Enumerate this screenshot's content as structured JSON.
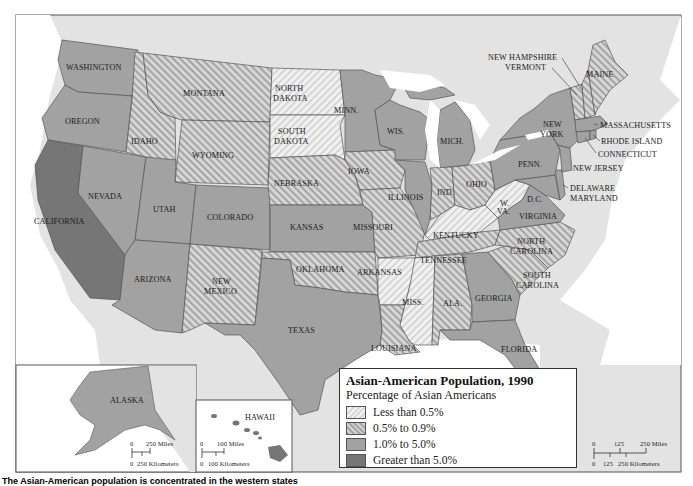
{
  "legend": {
    "title": "Asian-American Population, 1990",
    "subtitle": "Percentage of Asian Americans",
    "items": [
      {
        "label": "Less than 0.5%",
        "style": "light-hatch",
        "color": "#eeeeee"
      },
      {
        "label": "0.5% to 0.9%",
        "style": "dark-hatch",
        "color": "#c4c4c4"
      },
      {
        "label": "1.0% to 5.0%",
        "style": "solid-medium-gray",
        "color": "#a2a2a2"
      },
      {
        "label": "Greater than 5.0%",
        "style": "solid-dark-gray",
        "color": "#767676"
      }
    ]
  },
  "states": [
    {
      "name": "WASHINGTON",
      "category": "1.0% to 5.0%"
    },
    {
      "name": "OREGON",
      "category": "1.0% to 5.0%"
    },
    {
      "name": "CALIFORNIA",
      "category": "Greater than 5.0%"
    },
    {
      "name": "IDAHO",
      "category": "0.5% to 0.9%"
    },
    {
      "name": "MONTANA",
      "category": "0.5% to 0.9%"
    },
    {
      "name": "WYOMING",
      "category": "0.5% to 0.9%"
    },
    {
      "name": "NEVADA",
      "category": "1.0% to 5.0%"
    },
    {
      "name": "UTAH",
      "category": "1.0% to 5.0%"
    },
    {
      "name": "COLORADO",
      "category": "1.0% to 5.0%"
    },
    {
      "name": "ARIZONA",
      "category": "1.0% to 5.0%"
    },
    {
      "name": "NEW MEXICO",
      "category": "0.5% to 0.9%"
    },
    {
      "name": "NORTH DAKOTA",
      "category": "Less than 0.5%"
    },
    {
      "name": "SOUTH DAKOTA",
      "category": "Less than 0.5%"
    },
    {
      "name": "NEBRASKA",
      "category": "0.5% to 0.9%"
    },
    {
      "name": "KANSAS",
      "category": "1.0% to 5.0%"
    },
    {
      "name": "OKLAHOMA",
      "category": "0.5% to 0.9%"
    },
    {
      "name": "TEXAS",
      "category": "1.0% to 5.0%"
    },
    {
      "name": "MINN.",
      "category": "1.0% to 5.0%"
    },
    {
      "name": "IOWA",
      "category": "0.5% to 0.9%"
    },
    {
      "name": "MISSOURI",
      "category": "0.5% to 0.9%"
    },
    {
      "name": "ARKANSAS",
      "category": "Less than 0.5%"
    },
    {
      "name": "LOUISIANA",
      "category": "0.5% to 0.9%"
    },
    {
      "name": "WIS.",
      "category": "1.0% to 5.0%"
    },
    {
      "name": "ILLINOIS",
      "category": "1.0% to 5.0%"
    },
    {
      "name": "MICH.",
      "category": "1.0% to 5.0%"
    },
    {
      "name": "IND.",
      "category": "0.5% to 0.9%"
    },
    {
      "name": "OHIO",
      "category": "0.5% to 0.9%"
    },
    {
      "name": "KENTUCKY",
      "category": "Less than 0.5%"
    },
    {
      "name": "TENNESSEE",
      "category": "0.5% to 0.9%"
    },
    {
      "name": "MISS.",
      "category": "Less than 0.5%"
    },
    {
      "name": "ALA.",
      "category": "0.5% to 0.9%"
    },
    {
      "name": "GEORGIA",
      "category": "1.0% to 5.0%"
    },
    {
      "name": "FLORIDA",
      "category": "1.0% to 5.0%"
    },
    {
      "name": "SOUTH CAROLINA",
      "category": "0.5% to 0.9%"
    },
    {
      "name": "NORTH CAROLINA",
      "category": "0.5% to 0.9%"
    },
    {
      "name": "VIRGINIA",
      "category": "1.0% to 5.0%"
    },
    {
      "name": "W. VA.",
      "category": "Less than 0.5%"
    },
    {
      "name": "D.C.",
      "category": "1.0% to 5.0%"
    },
    {
      "name": "MARYLAND",
      "category": "1.0% to 5.0%"
    },
    {
      "name": "DELAWARE",
      "category": "1.0% to 5.0%"
    },
    {
      "name": "PENN.",
      "category": "1.0% to 5.0%"
    },
    {
      "name": "NEW JERSEY",
      "category": "1.0% to 5.0%"
    },
    {
      "name": "NEW YORK",
      "category": "1.0% to 5.0%"
    },
    {
      "name": "CONNECTICUT",
      "category": "1.0% to 5.0%"
    },
    {
      "name": "RHODE ISLAND",
      "category": "1.0% to 5.0%"
    },
    {
      "name": "MASSACHUSETTS",
      "category": "1.0% to 5.0%"
    },
    {
      "name": "VERMONT",
      "category": "0.5% to 0.9%"
    },
    {
      "name": "NEW HAMPSHIRE",
      "category": "0.5% to 0.9%"
    },
    {
      "name": "MAINE",
      "category": "0.5% to 0.9%"
    },
    {
      "name": "ALASKA",
      "category": "1.0% to 5.0%"
    },
    {
      "name": "HAWAII",
      "category": "Greater than 5.0%"
    }
  ],
  "labels": {
    "WA": "WASHINGTON",
    "OR": "OREGON",
    "CA": "CALIFORNIA",
    "ID": "IDAHO",
    "MT": "MONTANA",
    "WY": "WYOMING",
    "NV": "NEVADA",
    "UT": "UTAH",
    "CO": "COLORADO",
    "AZ": "ARIZONA",
    "NM1": "NEW",
    "NM2": "MEXICO",
    "ND1": "NORTH",
    "ND2": "DAKOTA",
    "SD1": "SOUTH",
    "SD2": "DAKOTA",
    "NE": "NEBRASKA",
    "KS": "KANSAS",
    "OK": "OKLAHOMA",
    "TX": "TEXAS",
    "MN": "MINN.",
    "IA": "IOWA",
    "MO": "MISSOURI",
    "AR": "ARKANSAS",
    "LA": "LOUISIANA",
    "WI": "WIS.",
    "IL": "ILLINOIS",
    "MI": "MICH.",
    "IN": "IND.",
    "OH": "OHIO",
    "KY": "KENTUCKY",
    "TN": "TENNESSEE",
    "MS": "MISS.",
    "AL": "ALA.",
    "GA": "GEORGIA",
    "FL": "FLORIDA",
    "SC1": "SOUTH",
    "SC2": "CAROLINA",
    "NC1": "NORTH",
    "NC2": "CAROLINA",
    "VA": "VIRGINIA",
    "WV1": "W.",
    "WV2": "VA.",
    "DC": "D.C.",
    "DE": "DELAWARE",
    "MD": "MARYLAND",
    "PA": "PENN.",
    "NJ": "NEW JERSEY",
    "NY1": "NEW",
    "NY2": "YORK",
    "CT": "CONNECTICUT",
    "RI": "RHODE ISLAND",
    "MA": "MASSACHUSETTS",
    "VT": "VERMONT",
    "NH": "NEW HAMPSHIRE",
    "ME": "MAINE",
    "AK": "ALASKA",
    "HI": "HAWAII"
  },
  "scales": {
    "alaska": {
      "miles": "250 Miles",
      "km": "250 Kilometers",
      "zero": "0"
    },
    "hawaii": {
      "miles": "100 Miles",
      "km": "100 Kilometers",
      "zero": "0"
    },
    "main": {
      "zero": "0",
      "mid": "125",
      "miles": "250 Miles",
      "km_mid": "125",
      "km": "250 Kilometers"
    }
  },
  "caption": "The Asian-American population is concentrated in the western states"
}
